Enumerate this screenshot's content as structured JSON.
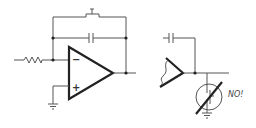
{
  "diagram": {
    "title": "",
    "left_circuit": {
      "name": "op-amp integrator with reset switch",
      "components": [
        "input-resistor",
        "feedback-capacitor",
        "reset-switch",
        "op-amp",
        "ground"
      ],
      "opamp": {
        "inverting_symbol": "−",
        "noninverting_symbol": "+"
      }
    },
    "right_circuit": {
      "name": "integrator output with JFET to ground",
      "components": [
        "feedback-capacitor",
        "op-amp-output",
        "jfet-crossed-out",
        "ground"
      ],
      "annotation": "NO!"
    },
    "colors": {
      "line": "#555555",
      "thick_line": "#222222",
      "background": "#ffffff"
    }
  }
}
